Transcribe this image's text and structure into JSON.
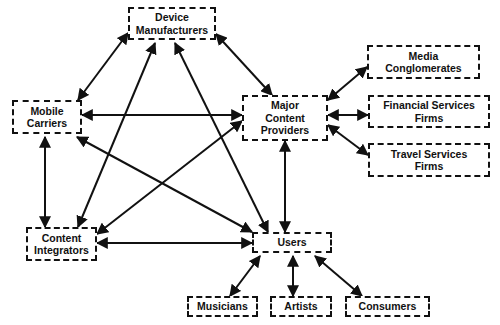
{
  "diagram": {
    "type": "network",
    "nodes": [
      {
        "id": "device",
        "label": "Device\nManufacturers",
        "x": 128,
        "y": 7,
        "w": 88,
        "h": 33
      },
      {
        "id": "mobile",
        "label": "Mobile\nCarriers",
        "x": 12,
        "y": 100,
        "w": 70,
        "h": 34
      },
      {
        "id": "major",
        "label": "Major\nContent\nProviders",
        "x": 242,
        "y": 95,
        "w": 86,
        "h": 46
      },
      {
        "id": "media",
        "label": "Media\nConglomerates",
        "x": 367,
        "y": 45,
        "w": 113,
        "h": 34
      },
      {
        "id": "fin",
        "label": "Financial Services\nFirms",
        "x": 368,
        "y": 95,
        "w": 122,
        "h": 33
      },
      {
        "id": "travel",
        "label": "Travel Services\nFirms",
        "x": 368,
        "y": 143,
        "w": 122,
        "h": 34
      },
      {
        "id": "integ",
        "label": "Content\nIntegrators",
        "x": 26,
        "y": 227,
        "w": 71,
        "h": 34
      },
      {
        "id": "users",
        "label": "Users",
        "x": 252,
        "y": 232,
        "w": 80,
        "h": 21
      },
      {
        "id": "musicians",
        "label": "Musicians",
        "x": 187,
        "y": 296,
        "w": 71,
        "h": 21
      },
      {
        "id": "artists",
        "label": "Artists",
        "x": 270,
        "y": 296,
        "w": 62,
        "h": 21
      },
      {
        "id": "consumers",
        "label": "Consumers",
        "x": 345,
        "y": 296,
        "w": 85,
        "h": 21
      }
    ],
    "edges": [
      {
        "from": "device",
        "to": "mobile",
        "x1": 128,
        "y1": 33,
        "x2": 78,
        "y2": 100
      },
      {
        "from": "mobile",
        "to": "major",
        "x1": 82,
        "y1": 115,
        "x2": 242,
        "y2": 115
      },
      {
        "from": "device",
        "to": "integ",
        "x1": 155,
        "y1": 43,
        "x2": 78,
        "y2": 227
      },
      {
        "from": "device",
        "to": "users",
        "x1": 175,
        "y1": 43,
        "x2": 268,
        "y2": 232
      },
      {
        "from": "device",
        "to": "major",
        "x1": 216,
        "y1": 34,
        "x2": 272,
        "y2": 95
      },
      {
        "from": "mobile",
        "to": "integ",
        "x1": 45,
        "y1": 137,
        "x2": 45,
        "y2": 227
      },
      {
        "from": "mobile",
        "to": "users",
        "x1": 77,
        "y1": 137,
        "x2": 252,
        "y2": 232
      },
      {
        "from": "major",
        "to": "integ",
        "x1": 242,
        "y1": 121,
        "x2": 97,
        "y2": 234
      },
      {
        "from": "major",
        "to": "media",
        "x1": 328,
        "y1": 100,
        "x2": 367,
        "y2": 67
      },
      {
        "from": "major",
        "to": "fin",
        "x1": 328,
        "y1": 115,
        "x2": 368,
        "y2": 115
      },
      {
        "from": "major",
        "to": "travel",
        "x1": 328,
        "y1": 125,
        "x2": 368,
        "y2": 155
      },
      {
        "from": "major",
        "to": "users",
        "x1": 285,
        "y1": 141,
        "x2": 285,
        "y2": 232
      },
      {
        "from": "integ",
        "to": "users",
        "x1": 97,
        "y1": 243,
        "x2": 252,
        "y2": 243
      },
      {
        "from": "users",
        "to": "musicians",
        "x1": 260,
        "y1": 256,
        "x2": 230,
        "y2": 296
      },
      {
        "from": "users",
        "to": "artists",
        "x1": 293,
        "y1": 256,
        "x2": 293,
        "y2": 296
      },
      {
        "from": "users",
        "to": "consumers",
        "x1": 315,
        "y1": 256,
        "x2": 362,
        "y2": 296
      }
    ],
    "line_color": "#111111",
    "background": "#ffffff"
  }
}
